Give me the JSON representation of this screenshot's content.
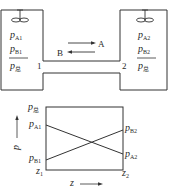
{
  "diagram": {
    "vessels": {
      "left": {
        "label_A": {
          "sym": "p",
          "sub": "A1"
        },
        "label_B": {
          "sym": "p",
          "sub": "B1"
        },
        "label_total": {
          "sym": "p",
          "sub": "总"
        },
        "end_label": "1"
      },
      "right": {
        "label_A": {
          "sym": "p",
          "sub": "A2"
        },
        "label_B": {
          "sym": "p",
          "sub": "B2"
        },
        "label_total": {
          "sym": "p",
          "sub": "总"
        },
        "end_label": "2"
      }
    },
    "arrows": {
      "A": "A",
      "B": "B"
    },
    "profile": {
      "axis_y": "p",
      "axis_x": "z",
      "top_left": {
        "sym": "p",
        "sub": "总"
      },
      "left_A": {
        "sym": "p",
        "sub": "A1"
      },
      "left_B": {
        "sym": "p",
        "sub": "B1"
      },
      "right_B": {
        "sym": "p",
        "sub": "B2"
      },
      "right_A": {
        "sym": "p",
        "sub": "A2"
      },
      "z1": {
        "sym": "z",
        "sub": "1"
      },
      "z2": {
        "sym": "z",
        "sub": "2"
      }
    }
  },
  "colors": {
    "line": "#333333",
    "background": "#ffffff"
  }
}
